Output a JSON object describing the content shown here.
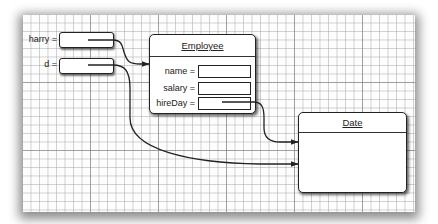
{
  "diagram": {
    "variables": [
      {
        "name": "harry",
        "label": "harry ="
      },
      {
        "name": "d",
        "label": "d ="
      }
    ],
    "employee": {
      "title": "Employee",
      "fields": [
        {
          "name": "name",
          "label": "name ="
        },
        {
          "name": "salary",
          "label": "salary ="
        },
        {
          "name": "hireDay",
          "label": "hireDay ="
        }
      ]
    },
    "date": {
      "title": "Date"
    },
    "references": [
      {
        "from": "harry",
        "to": "Employee"
      },
      {
        "from": "hireDay",
        "to": "Date"
      },
      {
        "from": "d",
        "to": "Date"
      }
    ],
    "colors": {
      "line": "#222222",
      "grid_minor": "#aaaaaa",
      "grid_major": "#787878",
      "paper": "#fdfdfd"
    }
  }
}
